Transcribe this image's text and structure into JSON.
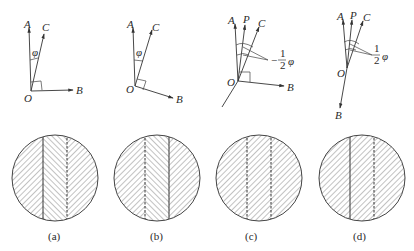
{
  "figure": {
    "panels": [
      {
        "id": "a",
        "caption": "(a)",
        "vectors": {
          "A": "A",
          "C": "C",
          "B": "B",
          "O": "O"
        },
        "angle_label": "φ",
        "boundary_left": "solid",
        "boundary_right": "dashed",
        "hatch": [
          "left",
          "right",
          "left"
        ]
      },
      {
        "id": "b",
        "caption": "(b)",
        "vectors": {
          "A": "A",
          "C": "C",
          "B": "B",
          "O": "O"
        },
        "angle_label": "φ",
        "boundary_left": "dashed",
        "boundary_right": "solid",
        "hatch": [
          "left",
          "right",
          "left"
        ]
      },
      {
        "id": "c",
        "caption": "(c)",
        "vectors": {
          "A": "A",
          "P": "P",
          "C": "C",
          "B": "B",
          "O": "O"
        },
        "angle_label_num": "1",
        "angle_label_den": "2",
        "angle_label_sym": "φ",
        "angle_prefix": "−",
        "boundary_left": "dashed",
        "boundary_right": "dashed",
        "hatch": [
          "left",
          "left",
          "left"
        ]
      },
      {
        "id": "d",
        "caption": "(d)",
        "vectors": {
          "A": "A",
          "P": "P",
          "C": "C",
          "B": "B",
          "O": "O"
        },
        "angle_label_num": "1",
        "angle_label_den": "2",
        "angle_label_sym": "φ",
        "boundary_left": "solid",
        "boundary_right": "dashed",
        "hatch": [
          "left",
          "left",
          "left"
        ]
      }
    ]
  }
}
